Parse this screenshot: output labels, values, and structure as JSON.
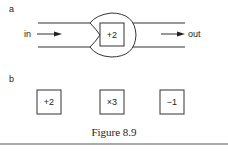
{
  "panel_a": {
    "label": "a",
    "input_label": "in",
    "output_label": "out",
    "box_label": "+2"
  },
  "panel_b": {
    "label": "b",
    "boxes": [
      {
        "label": "+2"
      },
      {
        "label": "×3"
      },
      {
        "label": "−1"
      }
    ]
  },
  "caption": "Figure 8.9",
  "colors": {
    "stroke": "#333333",
    "text": "#222222",
    "background": "#ffffff"
  }
}
